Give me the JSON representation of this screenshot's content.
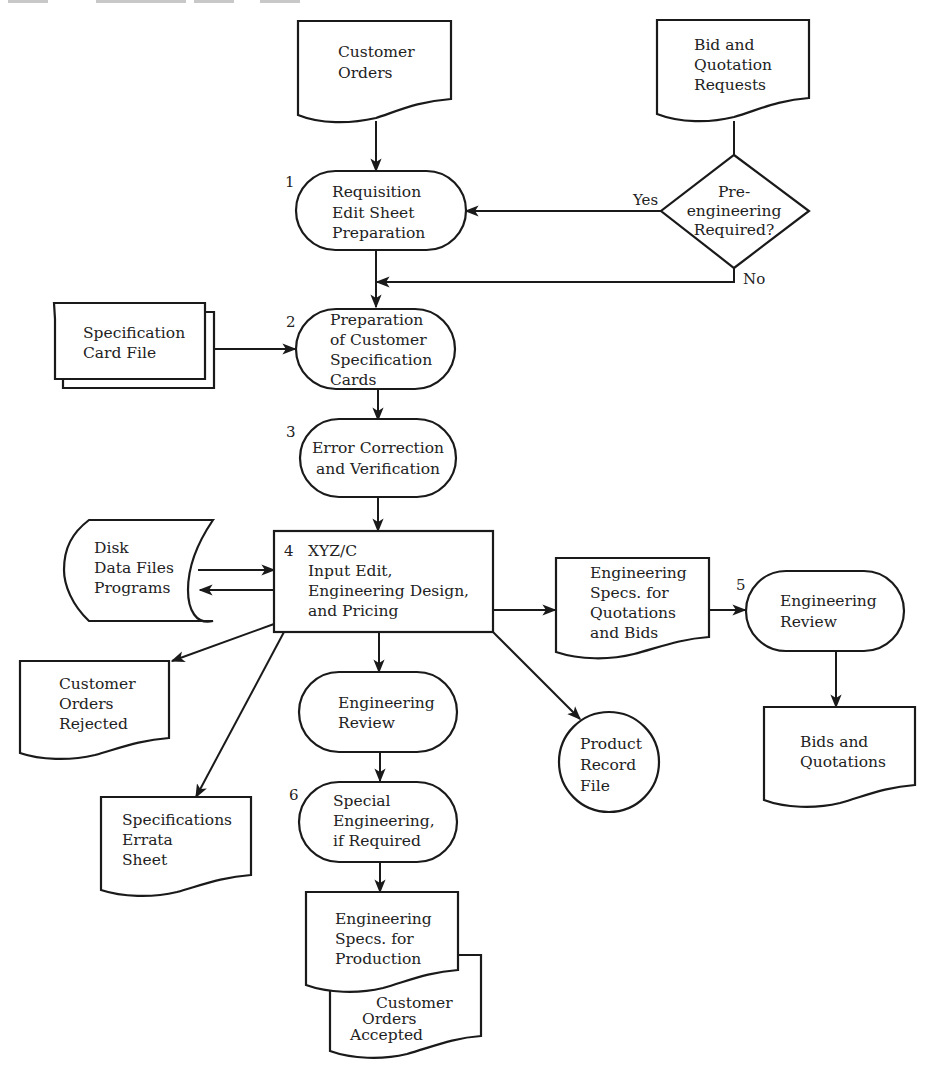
{
  "page": {
    "header_cropped": "332    DESIGN AND IMPLEMENTATION"
  },
  "diagram": {
    "type": "system flowchart",
    "nodes": {
      "customer_orders": {
        "shape": "document",
        "lines": [
          "Customer",
          "Orders"
        ]
      },
      "bid_requests": {
        "shape": "document",
        "lines": [
          "Bid and",
          "Quotation",
          "Requests"
        ]
      },
      "pre_engineering": {
        "shape": "decision",
        "lines": [
          "Pre-",
          "engineering",
          "Required?"
        ],
        "yes_label": "Yes",
        "no_label": "No"
      },
      "step1": {
        "shape": "terminal",
        "number": "1",
        "lines": [
          "Requisition",
          "Edit Sheet",
          "Preparation"
        ]
      },
      "spec_card_file": {
        "shape": "card-deck",
        "lines": [
          "Specification",
          "Card File"
        ]
      },
      "step2": {
        "shape": "terminal",
        "number": "2",
        "lines": [
          "Preparation",
          "of Customer",
          "Specification",
          "Cards"
        ]
      },
      "step3": {
        "shape": "terminal",
        "number": "3",
        "lines": [
          "Error Correction",
          "and Verification"
        ]
      },
      "disk": {
        "shape": "disk-storage",
        "lines": [
          "Disk",
          "Data Files",
          "Programs"
        ]
      },
      "step4": {
        "shape": "process",
        "number": "4",
        "lines": [
          "XYZ/C",
          "Input Edit,",
          "Engineering Design,",
          "and Pricing"
        ]
      },
      "eng_specs_quotes": {
        "shape": "document",
        "lines": [
          "Engineering",
          "Specs. for",
          "Quotations",
          "and Bids"
        ]
      },
      "step5": {
        "shape": "terminal",
        "number": "5",
        "lines": [
          "Engineering",
          "Review"
        ]
      },
      "bids_quotations": {
        "shape": "document",
        "lines": [
          "Bids and",
          "Quotations"
        ]
      },
      "orders_rejected": {
        "shape": "document",
        "lines": [
          "Customer",
          "Orders",
          "Rejected"
        ]
      },
      "errata_sheet": {
        "shape": "document",
        "lines": [
          "Specifications",
          "Errata",
          "Sheet"
        ]
      },
      "eng_review_mid": {
        "shape": "terminal",
        "lines": [
          "Engineering",
          "Review"
        ]
      },
      "product_record": {
        "shape": "circle",
        "lines": [
          "Product",
          "Record",
          "File"
        ]
      },
      "step6": {
        "shape": "terminal",
        "number": "6",
        "lines": [
          "Special",
          "Engineering,",
          "if Required"
        ]
      },
      "eng_specs_production": {
        "shape": "document",
        "lines": [
          "Engineering",
          "Specs. for",
          "Production"
        ]
      },
      "orders_accepted": {
        "shape": "document",
        "lines": [
          "Customer",
          "Orders",
          "Accepted"
        ]
      }
    },
    "edges": [
      {
        "from": "customer_orders",
        "to": "step1"
      },
      {
        "from": "bid_requests",
        "to": "pre_engineering"
      },
      {
        "from": "pre_engineering",
        "to": "step1",
        "label": "Yes"
      },
      {
        "from": "pre_engineering",
        "to": "step2",
        "label": "No"
      },
      {
        "from": "step1",
        "to": "step2"
      },
      {
        "from": "spec_card_file",
        "to": "step2"
      },
      {
        "from": "step2",
        "to": "step3"
      },
      {
        "from": "step3",
        "to": "step4"
      },
      {
        "from": "disk",
        "to": "step4"
      },
      {
        "from": "step4",
        "to": "disk"
      },
      {
        "from": "step4",
        "to": "eng_specs_quotes"
      },
      {
        "from": "eng_specs_quotes",
        "to": "step5"
      },
      {
        "from": "step5",
        "to": "bids_quotations"
      },
      {
        "from": "step4",
        "to": "orders_rejected"
      },
      {
        "from": "step4",
        "to": "errata_sheet"
      },
      {
        "from": "step4",
        "to": "eng_review_mid"
      },
      {
        "from": "step4",
        "to": "product_record"
      },
      {
        "from": "eng_review_mid",
        "to": "step6"
      },
      {
        "from": "step6",
        "to": "eng_specs_production"
      }
    ]
  }
}
